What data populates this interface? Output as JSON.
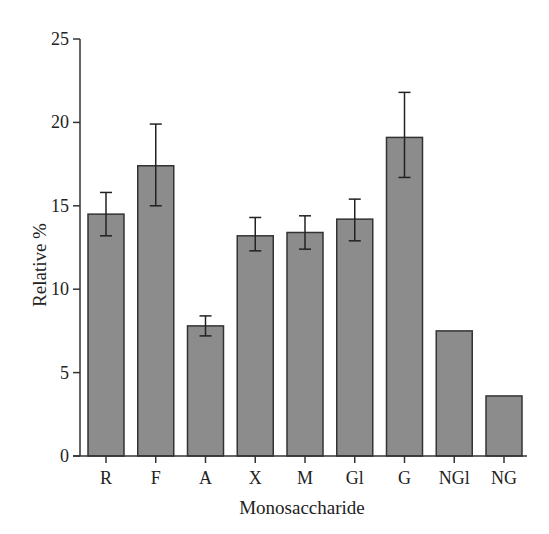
{
  "chart_data": {
    "type": "bar",
    "title": "",
    "xlabel": "Monosaccharide",
    "ylabel": "Relative %",
    "ylim": [
      0,
      25
    ],
    "yticks": [
      0,
      5,
      10,
      15,
      20,
      25
    ],
    "grid": false,
    "legend": null,
    "categories": [
      "R",
      "F",
      "A",
      "X",
      "M",
      "Gl",
      "G",
      "NGl",
      "NG"
    ],
    "values": [
      14.5,
      17.4,
      7.8,
      13.2,
      13.4,
      14.2,
      19.1,
      7.5,
      3.6
    ],
    "error_bars": [
      {
        "category": "R",
        "low": 13.2,
        "high": 15.8
      },
      {
        "category": "F",
        "low": 15.0,
        "high": 19.9
      },
      {
        "category": "A",
        "low": 7.2,
        "high": 8.4
      },
      {
        "category": "X",
        "low": 12.3,
        "high": 14.3
      },
      {
        "category": "M",
        "low": 12.4,
        "high": 14.4
      },
      {
        "category": "Gl",
        "low": 12.9,
        "high": 15.4
      },
      {
        "category": "G",
        "low": 16.7,
        "high": 21.8
      },
      {
        "category": "NGl",
        "low": null,
        "high": null
      },
      {
        "category": "NG",
        "low": null,
        "high": null
      }
    ],
    "colors": {
      "bar_fill": "#8c8c8c",
      "bar_stroke": "#333333",
      "axis": "#333333"
    }
  }
}
